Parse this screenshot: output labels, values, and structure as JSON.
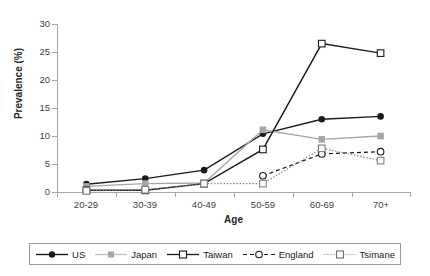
{
  "chart_data": {
    "type": "line",
    "title": "",
    "xlabel": "Age",
    "ylabel": "Prevalence (%)",
    "categories": [
      "20-29",
      "30-39",
      "40-49",
      "50-59",
      "60-69",
      "70+"
    ],
    "ylim": [
      0,
      30
    ],
    "yticks": [
      0,
      5,
      10,
      15,
      20,
      25,
      30
    ],
    "grid": false,
    "legend_position": "bottom",
    "series": [
      {
        "name": "US",
        "color": "#1a1a1a",
        "marker": "filled-circle",
        "line_style": "solid",
        "values": [
          1.4,
          2.4,
          3.9,
          10.4,
          13.0,
          13.5
        ]
      },
      {
        "name": "Japan",
        "color": "#a6a6a6",
        "marker": "filled-square",
        "line_style": "solid",
        "values": [
          1.0,
          1.5,
          1.6,
          11.1,
          9.4,
          10.0
        ]
      },
      {
        "name": "Taiwan",
        "color": "#1a1a1a",
        "marker": "open-square",
        "line_style": "solid",
        "values": [
          0.3,
          0.3,
          1.5,
          7.6,
          26.5,
          24.8
        ]
      },
      {
        "name": "England",
        "color": "#1a1a1a",
        "marker": "open-circle",
        "line_style": "dashed",
        "values": [
          null,
          null,
          null,
          2.9,
          6.8,
          7.2
        ]
      },
      {
        "name": "Tsimane",
        "color": "#808080",
        "marker": "open-square",
        "line_style": "dotted",
        "values": [
          0.2,
          0.4,
          1.5,
          1.5,
          7.8,
          5.6
        ]
      }
    ]
  },
  "axis": {
    "y_tick_labels": [
      "30",
      "25",
      "20",
      "15",
      "10",
      "5",
      "0"
    ],
    "x_tick_labels": [
      "20-29",
      "30-39",
      "40-49",
      "50-59",
      "60-69",
      "70+"
    ],
    "y_title": "Prevalence (%)",
    "x_title": "Age"
  },
  "legend": {
    "items": [
      {
        "label": "US"
      },
      {
        "label": "Japan"
      },
      {
        "label": "Taiwan"
      },
      {
        "label": "England"
      },
      {
        "label": "Tsimane"
      }
    ]
  }
}
